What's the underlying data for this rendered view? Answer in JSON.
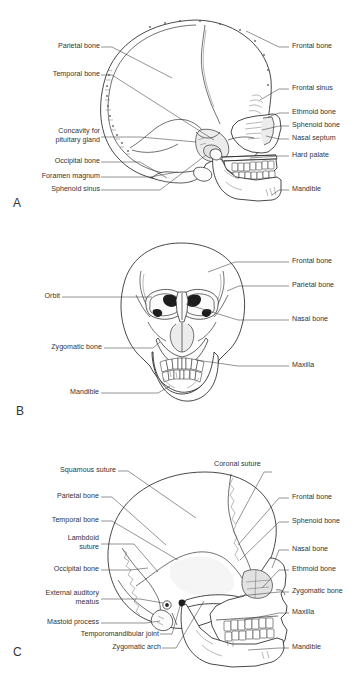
{
  "figure": {
    "background_color": "#ffffff",
    "text_color": "#333333",
    "line_color": "#1a1a1a"
  },
  "panels": [
    {
      "letter": "A",
      "view": "Lateral (sagittal section) view of skull",
      "labels_left": [
        "Parietal bone",
        "Temporal bone",
        "Concavity for",
        "pituitary gland",
        "Occipital bone",
        "Foramen magnum",
        "Sphenoid sinus"
      ],
      "labels_right": [
        "Frontal bone",
        "Frontal sinus",
        "Ethmoid bone",
        "Sphenoid bone",
        "Nasal septum",
        "Hard palate",
        "Mandible"
      ]
    },
    {
      "letter": "B",
      "view": "Anterior (frontal) view of skull",
      "labels_left": [
        "Orbit",
        "Zygomatic bone",
        "Mandible"
      ],
      "labels_right": [
        "Frontal bone",
        "Parietal bone",
        "Nasal bone",
        "Maxilla"
      ]
    },
    {
      "letter": "C",
      "view": "Lateral (external) view of skull",
      "labels_left": [
        "Squamous suture",
        "Parietal bone",
        "Temporal bone",
        "Lambdoid",
        "suture",
        "Occipital bone",
        "External auditory",
        "meatus",
        "Mastoid process",
        "Temporomandibular joint",
        "Zygomatic arch"
      ],
      "labels_right": [
        "Coronal suture",
        "Frontal bone",
        "Sphenoid bone",
        "Nasal bone",
        "Ethmoid bone",
        "Zygomatic bone",
        "Maxilla",
        "Mandible"
      ]
    }
  ],
  "labels": {
    "a_parietal": "Parietal bone",
    "a_temporal": "Temporal bone",
    "a_concavity1": "Concavity for",
    "a_concavity2": "pituitary gland",
    "a_occipital": "Occipital bone",
    "a_foramen": "Foramen magnum",
    "a_sphenoid_sinus": "Sphenoid sinus",
    "a_frontal": "Frontal bone",
    "a_frontal_sinus": "Frontal sinus",
    "a_ethmoid": "Ethmoid bone",
    "a_sphenoid": "Sphenoid bone",
    "a_nasal_septum": "Nasal septum",
    "a_hard_palate": "Hard palate",
    "a_mandible": "Mandible",
    "a_letter": "A",
    "b_orbit": "Orbit",
    "b_zygomatic": "Zygomatic bone",
    "b_mandible": "Mandible",
    "b_frontal": "Frontal bone",
    "b_parietal": "Parietal bone",
    "b_nasal": "Nasal bone",
    "b_maxilla": "Maxilla",
    "b_letter": "B",
    "c_squamous": "Squamous suture",
    "c_parietal": "Parietal bone",
    "c_temporal": "Temporal bone",
    "c_lambdoid1": "Lambdoid",
    "c_lambdoid2": "suture",
    "c_occipital": "Occipital bone",
    "c_eam1": "External auditory",
    "c_eam2": "meatus",
    "c_mastoid": "Mastoid process",
    "c_tmj": "Temporomandibular joint",
    "c_zyg_arch": "Zygomatic arch",
    "c_coronal": "Coronal suture",
    "c_frontal": "Frontal bone",
    "c_sphenoid": "Sphenoid bone",
    "c_nasal": "Nasal bone",
    "c_ethmoid": "Ethmoid bone",
    "c_zygomatic": "Zygomatic bone",
    "c_maxilla": "Maxilla",
    "c_mandible": "Mandible",
    "c_letter": "C"
  }
}
